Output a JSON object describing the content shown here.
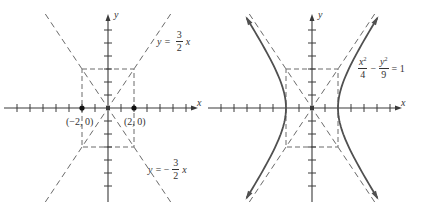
{
  "figures": [
    {
      "id": "left",
      "title": "",
      "axis_labels": {
        "x": "x",
        "y": "y"
      },
      "unit_px": 13,
      "origin_px": [
        108,
        108
      ],
      "x_ticks": [
        -7,
        -6,
        -5,
        -4,
        -3,
        -2,
        -1,
        1,
        2,
        3,
        4,
        5,
        6
      ],
      "y_ticks": [
        -6,
        -5,
        -4,
        -3,
        -2,
        -1,
        1,
        2,
        3,
        4,
        5,
        6
      ],
      "points": [
        {
          "label": "(−2, 0)",
          "x": -2,
          "y": 0
        },
        {
          "label": "(2, 0)",
          "x": 2,
          "y": 0
        }
      ],
      "rectangle": {
        "x_min": -2,
        "x_max": 2,
        "y_min": -3,
        "y_max": 3,
        "style": "dashed"
      },
      "asymptotes": [
        {
          "lhs": "y =",
          "sign": "",
          "num": "3",
          "den": "2",
          "var": "x",
          "slope": 1.5
        },
        {
          "lhs": "y =",
          "sign": "−",
          "num": "3",
          "den": "2",
          "var": "x",
          "slope": -1.5
        }
      ]
    },
    {
      "id": "right",
      "title": "",
      "axis_labels": {
        "x": "x",
        "y": "y"
      },
      "unit_px": 13,
      "origin_px": [
        312,
        108
      ],
      "x_ticks": [
        -7,
        -6,
        -5,
        -4,
        -3,
        -1,
        1,
        3,
        4,
        5,
        6
      ],
      "y_ticks": [
        -6,
        -5,
        -4,
        -3,
        -2,
        -1,
        1,
        2,
        3,
        4,
        5,
        6
      ],
      "rectangle": {
        "x_min": -2,
        "x_max": 2,
        "y_min": -3,
        "y_max": 3,
        "style": "dashed"
      },
      "asymptotes": [
        {
          "slope": 1.5
        },
        {
          "slope": -1.5
        }
      ],
      "curve": {
        "type": "hyperbola",
        "a": 2,
        "b": 3,
        "equation": {
          "term1_num": "x",
          "term1_sup": "2",
          "term1_den": "4",
          "op": "−",
          "term2_num": "y",
          "term2_sup": "2",
          "term2_den": "9",
          "rhs": "= 1"
        }
      }
    }
  ],
  "colors": {
    "axis": "#3a3a3a",
    "dashed": "#6a6a6a",
    "curve": "#505050",
    "point": "#111111",
    "text": "#333333"
  }
}
